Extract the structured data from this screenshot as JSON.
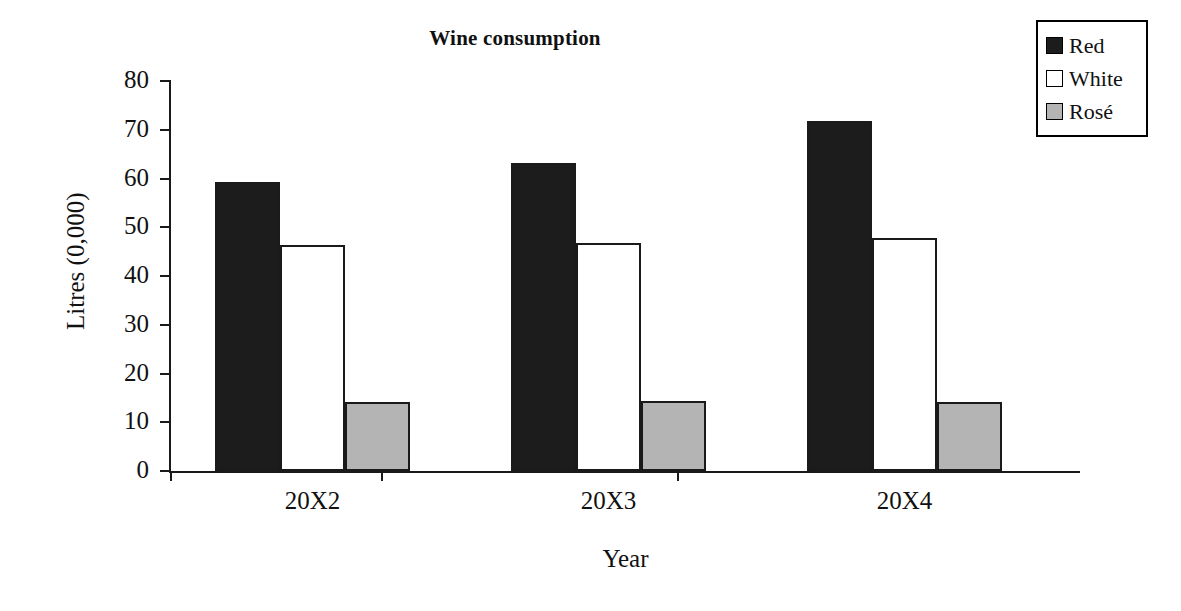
{
  "chart_data": {
    "type": "bar",
    "title": "Wine consumption",
    "xlabel": "Year",
    "ylabel": "Litres (0,000)",
    "categories": [
      "20X2",
      "20X3",
      "20X4"
    ],
    "series": [
      {
        "name": "Red",
        "color": "#1c1c1c",
        "values": [
          59.2,
          63.2,
          71.7
        ]
      },
      {
        "name": "White",
        "color": "#ffffff",
        "values": [
          46.4,
          46.7,
          47.7
        ]
      },
      {
        "name": "Rosé",
        "color": "#b4b4b4",
        "values": [
          14.2,
          14.3,
          14.1
        ]
      }
    ],
    "ylim": [
      0,
      80
    ],
    "yticks": [
      0,
      10,
      20,
      30,
      40,
      50,
      60,
      70,
      80
    ],
    "ytick_labels": [
      "0",
      "10",
      "20",
      "30",
      "40",
      "50",
      "60",
      "70",
      "80"
    ],
    "grid": false,
    "legend_position": "top-right",
    "legend_entries": [
      "Red",
      "White",
      "Rosé"
    ]
  }
}
